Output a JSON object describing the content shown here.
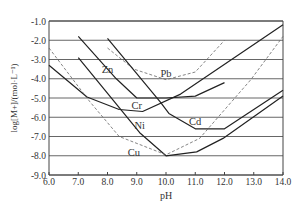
{
  "chart_data": {
    "type": "line",
    "title": "",
    "xlabel": "pH",
    "ylabel": "log[M+]/(mol·L⁻¹)",
    "xlim": [
      6.0,
      14.0
    ],
    "ylim": [
      -9.0,
      -1.0
    ],
    "x_ticks": [
      "6.0",
      "7.0",
      "8.0",
      "9.0",
      "10.0",
      "11.0",
      "12.0",
      "13.0",
      "14.0"
    ],
    "y_ticks": [
      "-1.0",
      "-2.0",
      "-3.0",
      "-4.0",
      "-5.0",
      "-6.0",
      "-7.0",
      "-8.0",
      "-9.0"
    ],
    "grid": "horizontal",
    "legend": "inline labels",
    "series": [
      {
        "name": "Zn",
        "style": "solid",
        "x": [
          7.0,
          8.3,
          9.0,
          10.0,
          11.0,
          12.0
        ],
        "y": [
          -1.8,
          -4.0,
          -5.0,
          -5.0,
          -4.9,
          -4.2
        ],
        "label_pos": [
          8.0,
          -3.7
        ]
      },
      {
        "name": "Pb",
        "style": "dashed",
        "x": [
          8.0,
          8.9,
          10.0,
          11.0,
          12.0
        ],
        "y": [
          -2.4,
          -3.5,
          -4.05,
          -3.65,
          -2.0
        ],
        "label_pos": [
          10.0,
          -3.9
        ]
      },
      {
        "name": "Cr",
        "style": "solid",
        "x": [
          6.0,
          7.3,
          8.4,
          9.2,
          10.5,
          14.0
        ],
        "y": [
          -3.3,
          -4.95,
          -5.6,
          -5.7,
          -4.8,
          -1.2
        ],
        "label_pos": [
          9.0,
          -5.55
        ]
      },
      {
        "name": "Cd",
        "style": "solid",
        "x": [
          8.0,
          9.8,
          10.1,
          11.0,
          12.0,
          14.0
        ],
        "y": [
          -1.9,
          -5.2,
          -5.8,
          -6.6,
          -6.6,
          -4.6
        ],
        "label_pos": [
          11.0,
          -6.4
        ]
      },
      {
        "name": "Ni",
        "style": "solid",
        "x": [
          7.0,
          9.1,
          10.0,
          11.05,
          11.95,
          14.0
        ],
        "y": [
          -2.9,
          -6.8,
          -8.0,
          -7.8,
          -7.1,
          -4.9
        ],
        "label_pos": [
          9.1,
          -6.6
        ]
      },
      {
        "name": "Cu",
        "style": "dashed",
        "x": [
          6.0,
          7.4,
          8.4,
          10.0,
          11.15,
          12.9,
          14.0
        ],
        "y": [
          -2.4,
          -5.2,
          -7.0,
          -7.95,
          -7.1,
          -4.05,
          -1.8
        ],
        "label_pos": [
          8.9,
          -8.0
        ]
      }
    ]
  }
}
